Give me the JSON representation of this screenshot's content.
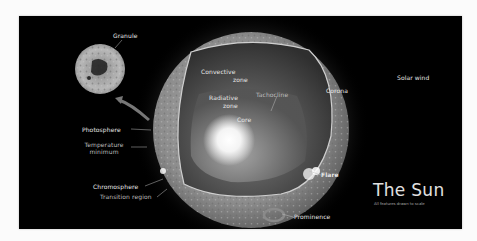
{
  "diagram": {
    "title": "The Sun",
    "subtitle": "All features drawn to scale",
    "labels": {
      "granule": "Granule",
      "solar_wind": "Solar wind",
      "convective_zone_line1": "Convective",
      "convective_zone_line2": "zone",
      "radiative_zone_line1": "Radiative",
      "radiative_zone_line2": "zone",
      "tachocline": "Tachocline",
      "core": "Core",
      "corona": "Corona",
      "photosphere": "Photosphere",
      "temperature_minimum_line1": "Temperature",
      "temperature_minimum_line2": "minimum",
      "chromosphere": "Chromosphere",
      "transition_region": "Transition region",
      "flare": "Flare",
      "prominence": "Prominence"
    },
    "colors": {
      "background": "#000000",
      "page": "#fbfbfb",
      "label_text": "#e8e8e8",
      "core_glow": "#ffffff"
    }
  }
}
